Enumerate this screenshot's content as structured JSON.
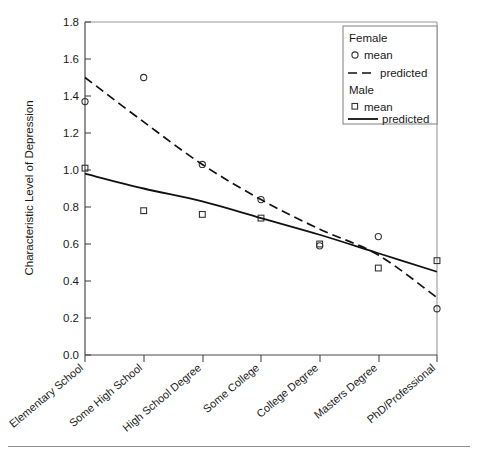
{
  "chart_data": {
    "type": "scatter",
    "title": "",
    "xlabel": "",
    "ylabel": "Characteristic Level of Depression",
    "ylim": [
      0.0,
      1.8
    ],
    "ytick_labels": [
      "0.0",
      "0.2",
      "0.4",
      "0.6",
      "0.8",
      "1.0",
      "1.2",
      "1.4",
      "1.6",
      "1.8"
    ],
    "ytick_values": [
      0.0,
      0.2,
      0.4,
      0.6,
      0.8,
      1.0,
      1.2,
      1.4,
      1.6,
      1.8
    ],
    "grid": false,
    "categories": [
      "Elementary School",
      "Some High School",
      "High School Degree",
      "Some College",
      "College Degree",
      "Masters Degree",
      "PhD/Professional"
    ],
    "series": [
      {
        "name": "Female mean",
        "group": "Female",
        "role": "mean",
        "marker": "circle",
        "values": [
          1.37,
          1.5,
          1.03,
          0.84,
          0.59,
          0.64,
          0.25
        ]
      },
      {
        "name": "Female predicted",
        "group": "Female",
        "role": "predicted",
        "line": "dashed",
        "values": [
          1.5,
          1.26,
          1.03,
          0.84,
          0.68,
          0.54,
          0.31
        ]
      },
      {
        "name": "Male mean",
        "group": "Male",
        "role": "mean",
        "marker": "square",
        "values": [
          1.01,
          0.78,
          0.76,
          0.74,
          0.6,
          0.47,
          0.51
        ]
      },
      {
        "name": "Male predicted",
        "group": "Male",
        "role": "predicted",
        "line": "solid",
        "values": [
          0.98,
          0.9,
          0.83,
          0.74,
          0.65,
          0.55,
          0.45
        ]
      }
    ],
    "legend_position": "top-right",
    "legend": {
      "groups": [
        {
          "title": "Female",
          "entries": [
            {
              "label": "mean",
              "symbol": "circle"
            },
            {
              "label": "predicted",
              "symbol": "dashed-line"
            }
          ]
        },
        {
          "title": "Male",
          "entries": [
            {
              "label": "mean",
              "symbol": "square"
            },
            {
              "label": "predicted",
              "symbol": "solid-line"
            }
          ]
        }
      ]
    },
    "colors": {
      "line": "#111111",
      "marker": "#333333",
      "axis": "#4a4a4a",
      "background": "#ffffff"
    }
  }
}
